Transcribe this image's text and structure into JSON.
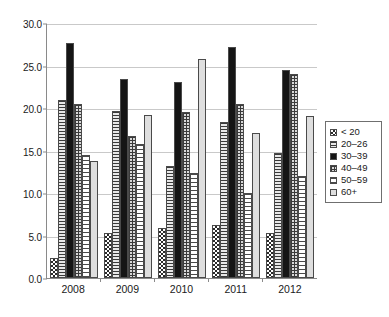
{
  "chart_data": {
    "type": "bar",
    "title": "",
    "subtitle": "",
    "xlabel": "",
    "ylabel": "",
    "categories": [
      "2008",
      "2009",
      "2010",
      "2011",
      "2012"
    ],
    "series": [
      {
        "name": "< 20",
        "pattern": "checkerboard",
        "values": [
          2.4,
          5.3,
          5.9,
          6.2,
          5.3
        ]
      },
      {
        "name": "20–26",
        "pattern": "horizontal-hatch",
        "values": [
          20.9,
          19.6,
          13.2,
          18.4,
          14.7
        ]
      },
      {
        "name": "30–39",
        "pattern": "solid-black",
        "values": [
          27.6,
          23.4,
          23.1,
          27.2,
          24.5
        ]
      },
      {
        "name": "40–49",
        "pattern": "crosshatch",
        "values": [
          20.5,
          16.7,
          19.5,
          20.5,
          24.0
        ]
      },
      {
        "name": "50–59",
        "pattern": "fine-horizontal",
        "values": [
          14.5,
          15.8,
          12.3,
          10.0,
          12.0
        ]
      },
      {
        "name": "60+",
        "pattern": "light-grey-solid",
        "values": [
          13.8,
          19.2,
          25.8,
          17.1,
          19.1
        ]
      }
    ],
    "ylim": [
      0,
      30
    ],
    "yticks": [
      "0.0",
      "5.0",
      "10.0",
      "15.0",
      "20.0",
      "25.0",
      "30.0"
    ],
    "ytick_values": [
      0,
      5,
      10,
      15,
      20,
      25,
      30
    ],
    "grid": true,
    "legend_position": "right",
    "colors": {
      "axis": "#8a8a8a",
      "gridline": "#c9c9c9",
      "bar_outline": "#4a4a4a",
      "solid_series": "#151515",
      "light_series": "#dedede",
      "background": "#ffffff",
      "text": "#1a1a1a"
    }
  }
}
